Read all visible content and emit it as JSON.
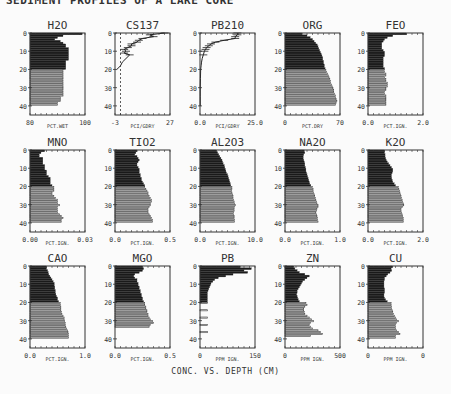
{
  "header_text": "SEDIMENT PROFILES OF A LAKE CORE",
  "footer_caption": "CONC. VS. DEPTH (CM)",
  "chart_data": [
    {
      "type": "bar",
      "title": "H2O",
      "xlabel": "PCT.WET",
      "xlim": [
        80,
        100
      ],
      "xticks_labels": [
        "80",
        "100"
      ],
      "ylabel": "Depth (cm)",
      "ylim": [
        0,
        45
      ],
      "yticks": [
        0,
        10,
        20,
        30,
        40
      ],
      "style": "horizontal-bars",
      "depths": [
        0,
        1,
        2,
        3,
        4,
        5,
        6,
        7,
        8,
        9,
        10,
        11,
        12,
        13,
        14,
        15,
        16,
        17,
        18,
        19,
        20,
        21,
        22,
        23,
        24,
        25,
        26,
        27,
        28,
        29,
        30,
        31,
        32,
        33,
        34,
        35,
        36,
        37,
        38,
        39
      ],
      "values": [
        99,
        92,
        90,
        89,
        91,
        92,
        93,
        93,
        94,
        94,
        94,
        94,
        94,
        94,
        94,
        93,
        93,
        93,
        93,
        93,
        92,
        92,
        92,
        92,
        92,
        92,
        92,
        92,
        92,
        92,
        92,
        92,
        92,
        92,
        92,
        91,
        91,
        91,
        90,
        90
      ]
    },
    {
      "type": "line",
      "title": "CS137",
      "xlabel": "PCI/GDRY",
      "xlim": [
        -3,
        27
      ],
      "xticks_labels": [
        "-3",
        "27"
      ],
      "ylim": [
        0,
        45
      ],
      "yticks": [
        0,
        10,
        20,
        30,
        40
      ],
      "style": "profile-with-errorbars",
      "reference_line_x": 0,
      "depths": [
        0,
        1,
        2,
        3,
        4,
        5,
        6,
        7,
        8,
        9,
        10,
        11,
        12,
        14,
        16,
        18,
        20
      ],
      "values": [
        24,
        16,
        18,
        12,
        10,
        9,
        6,
        6,
        4,
        2,
        3,
        2,
        5,
        3,
        1,
        0,
        -2
      ]
    },
    {
      "type": "line",
      "title": "PB210",
      "xlabel": "PCI/GDRY",
      "xlim": [
        0,
        25
      ],
      "xticks_labels": [
        "0.0",
        "25.0"
      ],
      "ylim": [
        0,
        45
      ],
      "yticks": [
        0,
        10,
        20,
        30,
        40
      ],
      "style": "profile-with-errorbars",
      "depths": [
        0,
        1,
        2,
        3,
        4,
        5,
        6,
        7,
        8,
        9,
        10,
        12,
        14,
        16,
        18,
        20,
        25,
        30,
        35,
        40
      ],
      "values": [
        17,
        17,
        16,
        16,
        11,
        7,
        5,
        4,
        3,
        2.5,
        2,
        1.5,
        1,
        0.7,
        0.5,
        0.3,
        0.2,
        0.1,
        0.1,
        0.1
      ]
    },
    {
      "type": "bar",
      "title": "ORG",
      "xlabel": "PCT.DRY",
      "xlim": [
        0,
        70
      ],
      "xticks_labels": [
        "0",
        "70"
      ],
      "ylim": [
        0,
        45
      ],
      "yticks": [
        0,
        10,
        20,
        30,
        40
      ],
      "style": "horizontal-bars",
      "depths": [
        0,
        1,
        2,
        3,
        4,
        5,
        6,
        7,
        8,
        9,
        10,
        11,
        12,
        13,
        14,
        15,
        16,
        17,
        18,
        19,
        20,
        21,
        22,
        23,
        24,
        25,
        26,
        27,
        28,
        29,
        30,
        31,
        32,
        33,
        34,
        35,
        36,
        37,
        38,
        39
      ],
      "values": [
        22,
        28,
        32,
        35,
        37,
        39,
        41,
        42,
        43,
        44,
        45,
        46,
        47,
        48,
        48,
        49,
        49,
        50,
        50,
        51,
        52,
        53,
        54,
        55,
        56,
        57,
        58,
        58,
        59,
        60,
        61,
        62,
        62,
        63,
        64,
        64,
        65,
        66,
        65,
        64
      ]
    },
    {
      "type": "bar",
      "title": "FEO",
      "xlabel": "PCT.IGN.",
      "xlim": [
        0.0,
        2.0
      ],
      "xticks_labels": [
        "0.0",
        "2.0"
      ],
      "ylim": [
        0,
        45
      ],
      "yticks": [
        0,
        10,
        20,
        30,
        40
      ],
      "style": "horizontal-bars",
      "depths": [
        0,
        1,
        2,
        3,
        4,
        5,
        6,
        7,
        8,
        9,
        10,
        11,
        12,
        13,
        14,
        15,
        16,
        17,
        18,
        19,
        20,
        21,
        22,
        23,
        24,
        25,
        26,
        27,
        28,
        29,
        30,
        31,
        32,
        33,
        34,
        35,
        36,
        37,
        38,
        39
      ],
      "values": [
        1.4,
        0.9,
        0.7,
        0.6,
        0.55,
        0.5,
        0.5,
        0.5,
        0.5,
        0.55,
        0.6,
        0.6,
        0.6,
        0.55,
        0.55,
        0.55,
        0.55,
        0.55,
        0.55,
        0.6,
        0.6,
        0.6,
        0.65,
        0.65,
        0.6,
        0.65,
        0.65,
        0.7,
        0.7,
        0.7,
        0.65,
        0.65,
        0.6,
        0.6,
        0.65,
        0.65,
        0.65,
        0.65,
        0.65,
        0.65
      ]
    },
    {
      "type": "bar",
      "title": "MNO",
      "xlabel": "PCT.IGN.",
      "xlim": [
        0.0,
        0.03
      ],
      "xticks_labels": [
        "0.00",
        "0.03"
      ],
      "ylim": [
        0,
        45
      ],
      "yticks": [
        0,
        10,
        20,
        30,
        40
      ],
      "style": "horizontal-bars",
      "depths": [
        0,
        1,
        2,
        3,
        4,
        5,
        6,
        7,
        8,
        9,
        10,
        11,
        12,
        13,
        14,
        15,
        16,
        17,
        18,
        19,
        20,
        21,
        22,
        23,
        24,
        25,
        26,
        27,
        28,
        29,
        30,
        31,
        32,
        33,
        34,
        35,
        36,
        37,
        38,
        39
      ],
      "values": [
        0.008,
        0.006,
        0.005,
        0.005,
        0.007,
        0.007,
        0.007,
        0.007,
        0.008,
        0.008,
        0.008,
        0.009,
        0.009,
        0.009,
        0.01,
        0.011,
        0.011,
        0.011,
        0.011,
        0.012,
        0.013,
        0.013,
        0.013,
        0.012,
        0.012,
        0.013,
        0.014,
        0.015,
        0.015,
        0.015,
        0.016,
        0.015,
        0.015,
        0.015,
        0.015,
        0.016,
        0.017,
        0.018,
        0.017,
        0.017
      ]
    },
    {
      "type": "bar",
      "title": "TIO2",
      "xlabel": "PCT.IGN.",
      "xlim": [
        0.0,
        0.5
      ],
      "xticks_labels": [
        "0.0",
        "0.5"
      ],
      "ylim": [
        0,
        45
      ],
      "yticks": [
        0,
        10,
        20,
        30,
        40
      ],
      "style": "horizontal-bars",
      "depths": [
        0,
        1,
        2,
        3,
        4,
        5,
        6,
        7,
        8,
        9,
        10,
        11,
        12,
        13,
        14,
        15,
        16,
        17,
        18,
        19,
        20,
        21,
        22,
        23,
        24,
        25,
        26,
        27,
        28,
        29,
        30,
        31,
        32,
        33,
        34,
        35,
        36,
        37,
        38,
        39
      ],
      "values": [
        0.2,
        0.19,
        0.18,
        0.2,
        0.21,
        0.22,
        0.21,
        0.2,
        0.2,
        0.21,
        0.22,
        0.22,
        0.22,
        0.23,
        0.23,
        0.24,
        0.24,
        0.25,
        0.26,
        0.27,
        0.27,
        0.28,
        0.29,
        0.3,
        0.3,
        0.31,
        0.32,
        0.33,
        0.33,
        0.32,
        0.32,
        0.31,
        0.3,
        0.3,
        0.3,
        0.31,
        0.32,
        0.33,
        0.34,
        0.34
      ]
    },
    {
      "type": "bar",
      "title": "AL2O3",
      "xlabel": "PCT.IGN.",
      "xlim": [
        0.0,
        10.0
      ],
      "xticks_labels": [
        "0.0",
        "10.0"
      ],
      "ylim": [
        0,
        45
      ],
      "yticks": [
        0,
        10,
        20,
        30,
        40
      ],
      "style": "horizontal-bars",
      "depths": [
        0,
        1,
        2,
        3,
        4,
        5,
        6,
        7,
        8,
        9,
        10,
        11,
        12,
        13,
        14,
        15,
        16,
        17,
        18,
        19,
        20,
        21,
        22,
        23,
        24,
        25,
        26,
        27,
        28,
        29,
        30,
        31,
        32,
        33,
        34,
        35,
        36,
        37,
        38,
        39
      ],
      "values": [
        3,
        3.2,
        3.4,
        3.6,
        3.8,
        4,
        4.1,
        4.2,
        4.4,
        4.5,
        4.6,
        4.7,
        4.8,
        5,
        5.1,
        5.2,
        5.3,
        5.4,
        5.5,
        5.6,
        5.8,
        5.8,
        5.7,
        5.8,
        5.9,
        6,
        6,
        6.1,
        6.2,
        6.3,
        6.4,
        6.3,
        6.2,
        6.2,
        6.1,
        6.1,
        6.2,
        6.2,
        6.3,
        6.3
      ]
    },
    {
      "type": "bar",
      "title": "NA2O",
      "xlabel": "PCT.IGN.",
      "xlim": [
        0.0,
        1.0
      ],
      "xticks_labels": [
        "0.0",
        "1.0"
      ],
      "ylim": [
        0,
        45
      ],
      "yticks": [
        0,
        10,
        20,
        30,
        40
      ],
      "style": "horizontal-bars",
      "depths": [
        0,
        1,
        2,
        3,
        4,
        5,
        6,
        7,
        8,
        9,
        10,
        11,
        12,
        13,
        14,
        15,
        16,
        17,
        18,
        19,
        20,
        21,
        22,
        23,
        24,
        25,
        26,
        27,
        28,
        29,
        30,
        31,
        32,
        33,
        34,
        35,
        36,
        37,
        38,
        39
      ],
      "values": [
        0.35,
        0.36,
        0.34,
        0.33,
        0.33,
        0.34,
        0.35,
        0.36,
        0.36,
        0.37,
        0.38,
        0.38,
        0.39,
        0.4,
        0.41,
        0.42,
        0.43,
        0.44,
        0.45,
        0.47,
        0.5,
        0.51,
        0.51,
        0.52,
        0.53,
        0.54,
        0.55,
        0.56,
        0.57,
        0.58,
        0.6,
        0.6,
        0.58,
        0.57,
        0.56,
        0.57,
        0.58,
        0.59,
        0.59,
        0.6
      ]
    },
    {
      "type": "bar",
      "title": "K2O",
      "xlabel": "PCT.IGN.",
      "xlim": [
        0.0,
        2.0
      ],
      "xticks_labels": [
        "0.0",
        "2.0"
      ],
      "ylim": [
        0,
        45
      ],
      "yticks": [
        0,
        10,
        20,
        30,
        40
      ],
      "style": "horizontal-bars",
      "depths": [
        0,
        1,
        2,
        3,
        4,
        5,
        6,
        7,
        8,
        9,
        10,
        11,
        12,
        13,
        14,
        15,
        16,
        17,
        18,
        19,
        20,
        21,
        22,
        23,
        24,
        25,
        26,
        27,
        28,
        29,
        30,
        31,
        32,
        33,
        34,
        35,
        36,
        37,
        38,
        39
      ],
      "values": [
        0.6,
        0.6,
        0.62,
        0.62,
        0.64,
        0.66,
        0.7,
        0.75,
        0.8,
        0.85,
        0.9,
        0.9,
        0.88,
        0.85,
        0.85,
        0.86,
        0.88,
        0.9,
        0.95,
        1.0,
        1.1,
        1.12,
        1.14,
        1.16,
        1.18,
        1.2,
        1.22,
        1.24,
        1.26,
        1.28,
        1.3,
        1.25,
        1.2,
        1.2,
        1.22,
        1.24,
        1.26,
        1.28,
        1.28,
        1.28
      ]
    },
    {
      "type": "bar",
      "title": "CAO",
      "xlabel": "PCT.IGN.",
      "xlim": [
        0.0,
        1.0
      ],
      "xticks_labels": [
        "0.0",
        "1.0"
      ],
      "ylim": [
        0,
        45
      ],
      "yticks": [
        0,
        10,
        20,
        30,
        40
      ],
      "style": "horizontal-bars",
      "depths": [
        0,
        1,
        2,
        3,
        4,
        5,
        6,
        7,
        8,
        9,
        10,
        11,
        12,
        13,
        14,
        15,
        16,
        17,
        18,
        19,
        20,
        21,
        22,
        23,
        24,
        25,
        26,
        27,
        28,
        29,
        30,
        31,
        32,
        33,
        34,
        35,
        36,
        37,
        38,
        39
      ],
      "values": [
        0.3,
        0.3,
        0.32,
        0.33,
        0.34,
        0.36,
        0.38,
        0.4,
        0.42,
        0.44,
        0.44,
        0.45,
        0.45,
        0.46,
        0.46,
        0.47,
        0.48,
        0.5,
        0.5,
        0.52,
        0.55,
        0.55,
        0.56,
        0.56,
        0.56,
        0.57,
        0.58,
        0.6,
        0.62,
        0.62,
        0.63,
        0.64,
        0.64,
        0.65,
        0.66,
        0.68,
        0.69,
        0.7,
        0.7,
        0.7
      ]
    },
    {
      "type": "bar",
      "title": "MGO",
      "xlabel": "PCT.IGN.",
      "xlim": [
        0.0,
        0.5
      ],
      "xticks_labels": [
        "0.0",
        "0.5"
      ],
      "ylim": [
        0,
        45
      ],
      "yticks": [
        0,
        10,
        20,
        30,
        40
      ],
      "style": "horizontal-bars",
      "depths": [
        0,
        1,
        2,
        3,
        4,
        5,
        6,
        7,
        8,
        9,
        10,
        11,
        12,
        13,
        14,
        15,
        16,
        17,
        18,
        19,
        20,
        21,
        22,
        23,
        24,
        25,
        26,
        27,
        28,
        29,
        30,
        31,
        32,
        33
      ],
      "values": [
        0.25,
        0.26,
        0.25,
        0.22,
        0.18,
        0.17,
        0.18,
        0.2,
        0.2,
        0.21,
        0.21,
        0.22,
        0.22,
        0.23,
        0.23,
        0.24,
        0.24,
        0.25,
        0.25,
        0.26,
        0.27,
        0.27,
        0.28,
        0.28,
        0.29,
        0.29,
        0.3,
        0.3,
        0.31,
        0.32,
        0.34,
        0.35,
        0.32,
        0.31
      ]
    },
    {
      "type": "bar",
      "title": "PB",
      "xlabel": "PPM IGN.",
      "xlim": [
        0,
        150
      ],
      "xticks_labels": [
        "0",
        "150"
      ],
      "ylim": [
        0,
        45
      ],
      "yticks": [
        0,
        10,
        20,
        30,
        40
      ],
      "style": "horizontal-bars",
      "depths": [
        0,
        1,
        2,
        3,
        4,
        5,
        6,
        7,
        8,
        9,
        10,
        11,
        12,
        13,
        14,
        15,
        16,
        17,
        18,
        19,
        20,
        24,
        28,
        32,
        36
      ],
      "values": [
        110,
        140,
        120,
        130,
        90,
        70,
        50,
        40,
        35,
        30,
        28,
        26,
        24,
        22,
        20,
        20,
        20,
        20,
        20,
        20,
        20,
        20,
        20,
        20,
        20
      ]
    },
    {
      "type": "bar",
      "title": "ZN",
      "xlabel": "PPM IGN.",
      "xlim": [
        0,
        500
      ],
      "xticks_labels": [
        "0",
        "500"
      ],
      "ylim": [
        0,
        45
      ],
      "yticks": [
        0,
        10,
        20,
        30,
        40
      ],
      "style": "horizontal-bars",
      "depths": [
        0,
        1,
        2,
        3,
        4,
        5,
        6,
        7,
        8,
        9,
        10,
        11,
        12,
        13,
        14,
        15,
        16,
        17,
        18,
        19,
        20,
        21,
        22,
        23,
        24,
        25,
        26,
        27,
        28,
        29,
        30,
        31,
        32,
        33,
        34,
        35,
        36,
        37,
        38
      ],
      "values": [
        80,
        90,
        110,
        130,
        180,
        220,
        200,
        180,
        160,
        150,
        140,
        130,
        120,
        110,
        110,
        105,
        110,
        115,
        120,
        130,
        190,
        200,
        180,
        170,
        170,
        175,
        180,
        200,
        220,
        240,
        260,
        230,
        220,
        230,
        250,
        300,
        320,
        340,
        230
      ]
    },
    {
      "type": "bar",
      "title": "CU",
      "xlabel": "PPM IGN.",
      "xlim": [
        0,
        0
      ],
      "xticks_labels": [
        "0",
        "0"
      ],
      "ylim": [
        0,
        45
      ],
      "yticks": [
        0,
        10,
        20,
        30,
        40
      ],
      "style": "horizontal-bars",
      "depths": [
        0,
        1,
        2,
        3,
        4,
        5,
        6,
        7,
        8,
        9,
        10,
        11,
        12,
        13,
        14,
        15,
        16,
        17,
        18,
        19,
        20,
        21,
        22,
        23,
        24,
        25,
        26,
        27,
        28,
        29,
        30,
        31,
        32,
        33,
        34,
        35,
        36,
        37,
        38,
        39
      ],
      "values": [
        0.45,
        0.42,
        0.43,
        0.4,
        0.36,
        0.33,
        0.3,
        0.3,
        0.29,
        0.29,
        0.29,
        0.29,
        0.3,
        0.3,
        0.3,
        0.29,
        0.29,
        0.3,
        0.32,
        0.35,
        0.42,
        0.42,
        0.43,
        0.43,
        0.44,
        0.45,
        0.46,
        0.48,
        0.5,
        0.52,
        0.55,
        0.52,
        0.5,
        0.5,
        0.5,
        0.52,
        0.55,
        0.58,
        0.5,
        0.5
      ],
      "values_note": "fraction of axis width (axis max label printed as 0)"
    }
  ]
}
